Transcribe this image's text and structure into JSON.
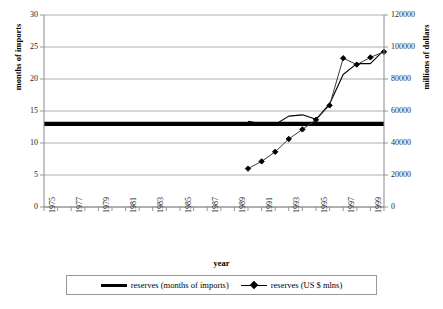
{
  "chart_data": {
    "type": "line",
    "title": "",
    "xlabel": "year",
    "ylabel": "months of imports",
    "ylabel_right": "millions of dollars",
    "x": [
      1975,
      1976,
      1977,
      1978,
      1979,
      1980,
      1981,
      1982,
      1983,
      1984,
      1985,
      1986,
      1987,
      1988,
      1989,
      1990,
      1991,
      1992,
      1993,
      1994,
      1995,
      1996,
      1997,
      1998,
      1999,
      2000
    ],
    "xtick_labels": [
      "1975",
      "1977",
      "1979",
      "1981",
      "1983",
      "1985",
      "1987",
      "1989",
      "1991",
      "1993",
      "1995",
      "1997",
      "1999"
    ],
    "xlim": [
      1975,
      2000
    ],
    "ylim": [
      0,
      30
    ],
    "yticks": [
      "0",
      "5",
      "10",
      "15",
      "20",
      "25",
      "30"
    ],
    "ylim_right": [
      0,
      120000
    ],
    "yticks_right": [
      "0",
      "20000",
      "40000",
      "60000",
      "80000",
      "100000",
      "120000"
    ],
    "grid": true,
    "legend_position": "bottom",
    "series": [
      {
        "name": "reserves (months of imports)",
        "axis": "left",
        "style": "thick-flat",
        "values": [
          13.0,
          13.0,
          13.0,
          13.0,
          13.0,
          13.0,
          13.0,
          13.0,
          13.0,
          13.0,
          13.0,
          13.0,
          13.0,
          13.0,
          13.0,
          13.0,
          13.0,
          13.0,
          13.0,
          13.0,
          13.0,
          13.0,
          13.0,
          13.0,
          13.0,
          13.0
        ]
      },
      {
        "name": "reserves (months of imports) observed",
        "axis": "left",
        "style": "thin",
        "values": [
          null,
          null,
          null,
          null,
          null,
          null,
          null,
          null,
          null,
          null,
          null,
          null,
          null,
          null,
          null,
          13.4,
          13.0,
          12.9,
          14.2,
          14.4,
          13.7,
          16.1,
          20.7,
          22.4,
          22.4,
          24.5
        ]
      },
      {
        "name": "reserves (US $ mlns)",
        "axis": "right",
        "style": "marker",
        "values": [
          null,
          null,
          null,
          null,
          null,
          null,
          null,
          null,
          null,
          null,
          null,
          null,
          null,
          null,
          null,
          24000,
          28500,
          34500,
          42500,
          48500,
          54500,
          63500,
          93000,
          89000,
          93500,
          97000
        ]
      }
    ]
  },
  "legend": {
    "entries": [
      {
        "label": "reserves (months of imports)",
        "marker": "thick-line"
      },
      {
        "label": "reserves (US $ mlns)",
        "marker": "diamond-line"
      }
    ]
  },
  "colors": {
    "line": "#000000",
    "grid": "#9a9a9a",
    "axis": "#6f6f6f",
    "text": "#000000",
    "background": "#ffffff"
  }
}
